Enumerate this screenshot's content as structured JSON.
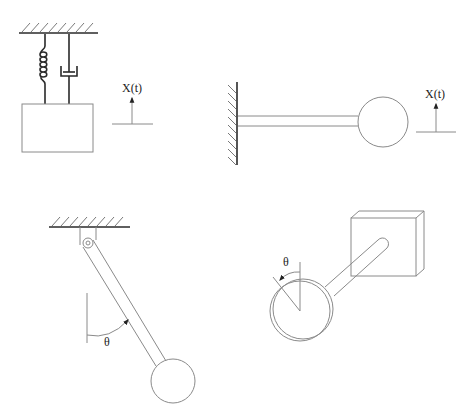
{
  "figure": {
    "panels": [
      {
        "id": "spring-mass-damper",
        "components": [
          "fixed-ceiling",
          "spring",
          "damper",
          "mass-block",
          "displacement-arrow"
        ],
        "label": "X(t)"
      },
      {
        "id": "cantilever-beam-mass",
        "components": [
          "fixed-wall",
          "beam",
          "end-mass",
          "displacement-arrow"
        ],
        "label": "X(t)"
      },
      {
        "id": "simple-pendulum",
        "components": [
          "fixed-ceiling",
          "pivot-bracket",
          "rod",
          "bob",
          "angle-arc"
        ],
        "label": "θ"
      },
      {
        "id": "torsional-pendulum",
        "components": [
          "fixed-block",
          "shaft",
          "disk",
          "angle-arc"
        ],
        "label": "θ"
      }
    ]
  }
}
